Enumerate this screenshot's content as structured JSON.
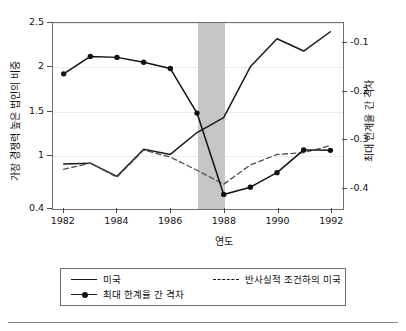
{
  "chart_data": {
    "type": "line",
    "title": "",
    "xlabel": "연도",
    "ylabel": "가장 경쟁력 높은 법인의 비중",
    "ylabel_right": "최대 한계율 간 격차",
    "x": [
      1982,
      1983,
      1984,
      1985,
      1986,
      1987,
      1988,
      1989,
      1990,
      1991,
      1992
    ],
    "xlim": [
      1981.6,
      1992.4
    ],
    "xticks": [
      1982,
      1984,
      1986,
      1988,
      1990,
      1992
    ],
    "xticklabels": [
      "1982",
      "1984",
      "1986",
      "1988",
      "1990",
      "1992"
    ],
    "ylim": [
      0.4,
      2.5
    ],
    "yticks": [
      0.4,
      1,
      1.5,
      2,
      2.5
    ],
    "yticklabels": [
      "0.4",
      "1",
      "1.5",
      "2",
      "2.5"
    ],
    "ylim_right": [
      -0.44,
      -0.06
    ],
    "yticks_right": [
      -0.4,
      -0.3,
      -0.2,
      -0.1
    ],
    "yticklabels_right": [
      "-0.4",
      "-0.3",
      "-0.2",
      "-0.1"
    ],
    "grid": true,
    "grid_color": "#ececec",
    "legend_position": "below-plot",
    "shaded_region": {
      "label": "",
      "x_start": 1987,
      "x_end": 1988,
      "color": "#c6c6c6"
    },
    "series": [
      {
        "name": "미국",
        "axis": "left",
        "style": "solid",
        "marker": "none",
        "color": "#1a1a1a",
        "values": [
          0.89,
          0.9,
          0.75,
          1.06,
          1.0,
          1.25,
          1.42,
          2.0,
          2.32,
          2.18,
          2.4
        ]
      },
      {
        "name": "반사실적 조건하의 미국",
        "axis": "left",
        "style": "dashed",
        "marker": "none",
        "color": "#4d4d4d",
        "values": [
          0.83,
          0.9,
          0.74,
          1.05,
          0.97,
          0.82,
          0.66,
          0.88,
          1.0,
          1.02,
          1.1
        ]
      },
      {
        "name": "최대 한계율 간 격차",
        "axis": "right",
        "style": "solid",
        "marker": "circle",
        "color": "#111111",
        "values": [
          -0.165,
          -0.129,
          -0.131,
          -0.141,
          -0.154,
          -0.246,
          -0.414,
          -0.399,
          -0.369,
          -0.322,
          -0.323
        ]
      }
    ]
  },
  "legend": {
    "items": [
      {
        "label": "미국",
        "style": "solid",
        "marker": "none"
      },
      {
        "label": "최대 한계율 간 격차",
        "style": "solid",
        "marker": "circle"
      },
      {
        "label": "반사실적 조건하의 미국",
        "style": "dashed",
        "marker": "none"
      }
    ]
  }
}
